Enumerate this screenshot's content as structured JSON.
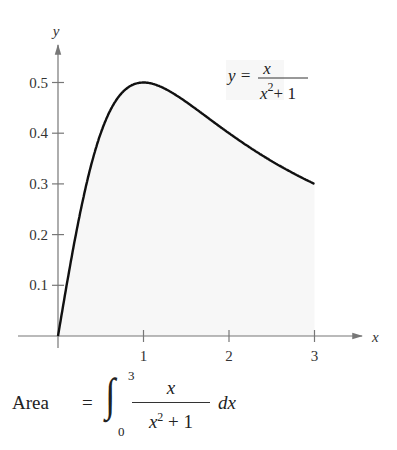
{
  "chart_data": {
    "type": "area",
    "title": "",
    "function": "y = x / (x^2 + 1)",
    "xlabel": "x",
    "ylabel": "y",
    "xlim": [
      0,
      3.3
    ],
    "ylim": [
      0,
      0.55
    ],
    "x_ticks": [
      1,
      2,
      3
    ],
    "y_ticks": [
      0.1,
      0.2,
      0.3,
      0.4,
      0.5
    ],
    "x_tick_labels": [
      "1",
      "2",
      "3"
    ],
    "y_tick_labels": [
      "0.1",
      "0.2",
      "0.3",
      "0.4",
      "0.5"
    ],
    "grid": false,
    "shaded_region": {
      "from": 0,
      "to": 3,
      "color": "#f7f7f7"
    },
    "x": [
      0,
      0.25,
      0.5,
      0.75,
      1,
      1.25,
      1.5,
      1.75,
      2,
      2.25,
      2.5,
      2.75,
      3
    ],
    "values": [
      0,
      0.235,
      0.4,
      0.48,
      0.5,
      0.488,
      0.462,
      0.431,
      0.4,
      0.371,
      0.345,
      0.321,
      0.3
    ],
    "annotations": [
      {
        "text": "y = x / (x^2 + 1)",
        "position": [
          2.2,
          0.49
        ]
      }
    ],
    "curve_color": "#111111",
    "axis_color": "#777777"
  },
  "labels": {
    "y_axis": "y",
    "x_axis": "x",
    "eq_lhs": "y =",
    "eq_num": "x",
    "eq_den_base": "x",
    "eq_den_exp": "2",
    "eq_den_rest": "+ 1"
  },
  "formula": {
    "word": "Area",
    "equals": "=",
    "integral_sign": "∫",
    "upper": "3",
    "lower": "0",
    "numerator": "x",
    "denominator_base": "x",
    "denominator_exp": "2",
    "denominator_rest": " + 1",
    "differential": "dx"
  }
}
